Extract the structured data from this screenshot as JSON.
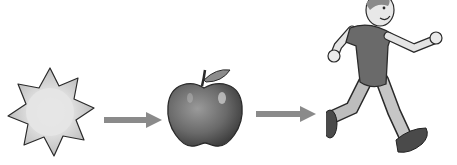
{
  "diagram": {
    "title": "",
    "nodes": [
      {
        "id": "sun",
        "label": "Sun",
        "icon": "sun-icon"
      },
      {
        "id": "apple",
        "label": "Apple",
        "icon": "apple-icon"
      },
      {
        "id": "runner",
        "label": "Running boy",
        "icon": "running-boy-icon"
      }
    ],
    "edges": [
      {
        "from": "sun",
        "to": "apple",
        "icon": "arrow-right-icon"
      },
      {
        "from": "apple",
        "to": "runner",
        "icon": "arrow-right-icon"
      }
    ],
    "colors": {
      "background": "#ffffff",
      "arrow": "#8a8a8a",
      "sun_fill": "#c8c8c8",
      "sun_core": "#e2e2e2",
      "apple_fill": "#6e6e6e",
      "outline": "#2a2a2a"
    }
  }
}
